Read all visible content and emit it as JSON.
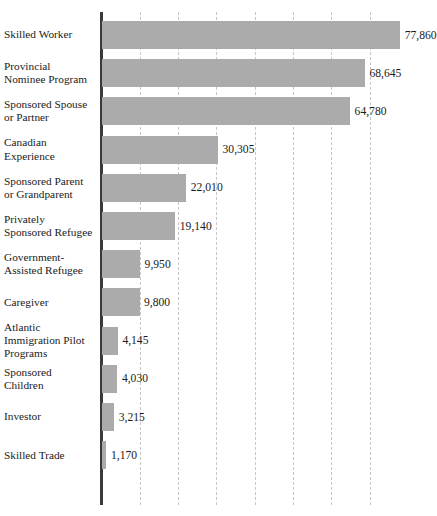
{
  "chart_data": {
    "type": "bar",
    "orientation": "horizontal",
    "title": "",
    "xlabel": "",
    "ylabel": "",
    "xlim": [
      0,
      82000
    ],
    "grid": true,
    "grid_axis": "x",
    "grid_style": "dashed",
    "legend": false,
    "bar_color": "#ababab",
    "axis_color": "#3a3a3a",
    "gridline_color": "#c6c6c6",
    "gridline_step": 10000,
    "gridline_values": [
      10000,
      20000,
      30000,
      40000,
      50000,
      60000,
      70000
    ],
    "categories": [
      "Skilled Worker",
      "Provincial Nominee Program",
      "Sponsored Spouse or Partner",
      "Canadian Experience",
      "Sponsored Parent or Grandparent",
      "Privately Sponsored Refugee",
      "Government-Assisted Refugee",
      "Caregiver",
      "Atlantic Immigration Pilot Programs",
      "Sponsored Children",
      "Investor",
      "Skilled Trade"
    ],
    "values": [
      77860,
      68645,
      64780,
      30305,
      22010,
      19140,
      9950,
      9800,
      4145,
      4030,
      3215,
      1170
    ],
    "value_labels": [
      "77,860",
      "68,645",
      "64,780",
      "30,305",
      "22,010",
      "19,140",
      "9,950",
      "9,800",
      "4,145",
      "4,030",
      "3,215",
      "1,170"
    ]
  },
  "rows": [
    {
      "label_lines": [
        "Skilled Worker"
      ],
      "value_label": "77,860",
      "value": 77860
    },
    {
      "label_lines": [
        "Provincial",
        "Nominee Program"
      ],
      "value_label": "68,645",
      "value": 68645
    },
    {
      "label_lines": [
        "Sponsored Spouse",
        "or Partner"
      ],
      "value_label": "64,780",
      "value": 64780
    },
    {
      "label_lines": [
        "Canadian",
        "Experience"
      ],
      "value_label": "30,305",
      "value": 30305
    },
    {
      "label_lines": [
        "Sponsored Parent",
        "or Grandparent"
      ],
      "value_label": "22,010",
      "value": 22010
    },
    {
      "label_lines": [
        "Privately",
        "Sponsored Refugee"
      ],
      "value_label": "19,140",
      "value": 19140
    },
    {
      "label_lines": [
        "Government-",
        "Assisted Refugee"
      ],
      "value_label": "9,950",
      "value": 9950
    },
    {
      "label_lines": [
        "Caregiver"
      ],
      "value_label": "9,800",
      "value": 9800
    },
    {
      "label_lines": [
        "Atlantic",
        "Immigration Pilot",
        "Programs"
      ],
      "value_label": "4,145",
      "value": 4145
    },
    {
      "label_lines": [
        "Sponsored",
        "Children"
      ],
      "value_label": "4,030",
      "value": 4030
    },
    {
      "label_lines": [
        "Investor"
      ],
      "value_label": "3,215",
      "value": 3215
    },
    {
      "label_lines": [
        "Skilled Trade"
      ],
      "value_label": "1,170",
      "value": 1170
    }
  ]
}
